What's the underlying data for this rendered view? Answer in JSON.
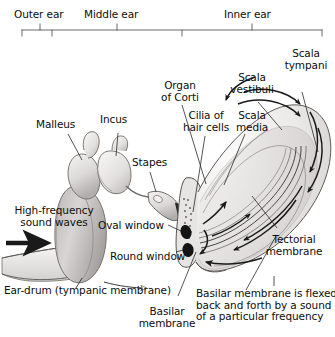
{
  "figure": {
    "regions": [
      {
        "id": "outer",
        "label": "Outer ear"
      },
      {
        "id": "middle",
        "label": "Middle ear"
      },
      {
        "id": "inner",
        "label": "Inner ear"
      }
    ],
    "labels": {
      "scala_tympani": "Scala\ntympani",
      "scala_vestibuli": "Scala\nvestibuli",
      "scala_media": "Scala\nmedia",
      "organ_of_corti": "Organ\nof Corti",
      "cilia_of_hair_cells": "Cilia of\nhair cells",
      "malleus": "Malleus",
      "incus": "Incus",
      "stapes": "Stapes",
      "high_frequency_sound_waves": "High-frequency\nsound waves",
      "oval_window": "Oval window",
      "round_window": "Round window",
      "ear_drum": "Ear-drum (tympanic membrane)",
      "tectorial_membrane": "Tectorial\nmembrane",
      "basilar_membrane": "Basilar\nmembrane"
    },
    "caption": "Basilar membrane is flexed\nback and forth by a sound\nof a particular frequency",
    "colors": {
      "background": "#ffffff",
      "ink": "#0d0d0d",
      "line": "#4a4a4a",
      "bracket": "#5a5a5a",
      "tissue_light": "#f0efee",
      "tissue_mid": "#cfcdcb",
      "tissue_dark": "#9a9795",
      "window_fill": "#141414",
      "arrow": "#1a1a1a"
    }
  }
}
